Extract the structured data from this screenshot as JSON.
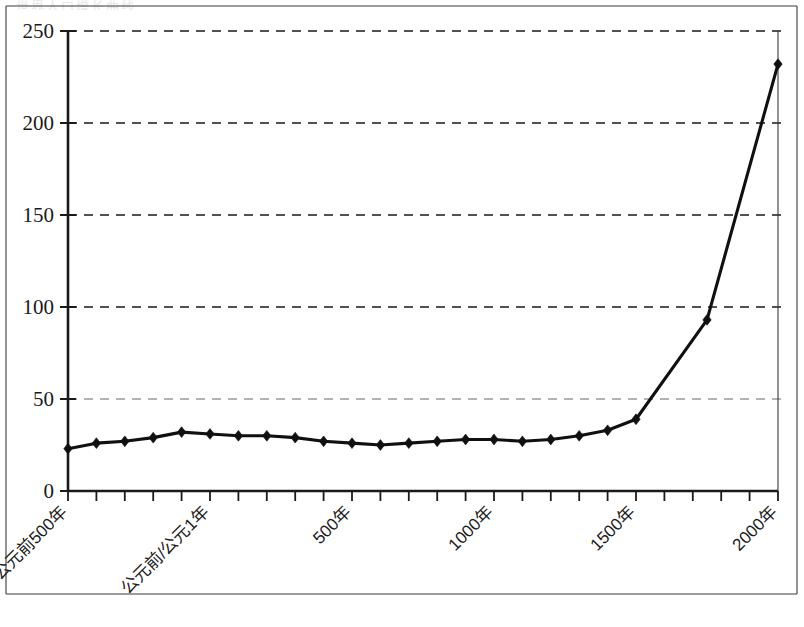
{
  "title": {
    "text": "世界人口增长曲线",
    "visible_faint": true
  },
  "chart_data": {
    "type": "line",
    "title": "世界人口增长曲线",
    "xlabel": "",
    "ylabel": "",
    "ylim": [
      0,
      250
    ],
    "yticks": [
      0,
      50,
      100,
      150,
      200,
      250
    ],
    "ytick_labels": [
      "0",
      "50",
      "100",
      "150",
      "200",
      "250"
    ],
    "xlim": [
      -500,
      2000
    ],
    "xtick_labels": [
      "公元前500年",
      "公元前/公元1年",
      "500年",
      "1000年",
      "1500年",
      "2000年"
    ],
    "xtick_label_positions": [
      -500,
      0,
      500,
      1000,
      1500,
      2000
    ],
    "grid": true,
    "grid_style": "dashed",
    "legend": "none",
    "marker": "diamond",
    "line_color": "#101010",
    "x": [
      -500,
      -400,
      -300,
      -200,
      -100,
      0,
      100,
      200,
      300,
      400,
      500,
      600,
      700,
      800,
      900,
      1000,
      1100,
      1200,
      1300,
      1400,
      1500,
      1600,
      1700,
      1750,
      1800,
      1900,
      2000
    ],
    "values": [
      23,
      26,
      27,
      29,
      32,
      31,
      30,
      30,
      29,
      27,
      26,
      25,
      26,
      27,
      28,
      28,
      27,
      28,
      30,
      33,
      39,
      93,
      232,
      null,
      null,
      null,
      null
    ],
    "series": [
      {
        "name": "世界人口",
        "points": [
          {
            "x": -500,
            "y": 23
          },
          {
            "x": -400,
            "y": 26
          },
          {
            "x": -300,
            "y": 27
          },
          {
            "x": -200,
            "y": 29
          },
          {
            "x": -100,
            "y": 32
          },
          {
            "x": 0,
            "y": 31
          },
          {
            "x": 100,
            "y": 30
          },
          {
            "x": 200,
            "y": 30
          },
          {
            "x": 300,
            "y": 29
          },
          {
            "x": 400,
            "y": 27
          },
          {
            "x": 500,
            "y": 26
          },
          {
            "x": 600,
            "y": 25
          },
          {
            "x": 700,
            "y": 26
          },
          {
            "x": 800,
            "y": 27
          },
          {
            "x": 900,
            "y": 28
          },
          {
            "x": 1000,
            "y": 28
          },
          {
            "x": 1100,
            "y": 27
          },
          {
            "x": 1200,
            "y": 28
          },
          {
            "x": 1300,
            "y": 30
          },
          {
            "x": 1400,
            "y": 33
          },
          {
            "x": 1500,
            "y": 39
          },
          {
            "x": 1750,
            "y": 93
          },
          {
            "x": 2000,
            "y": 232
          }
        ]
      }
    ],
    "annotations": []
  }
}
